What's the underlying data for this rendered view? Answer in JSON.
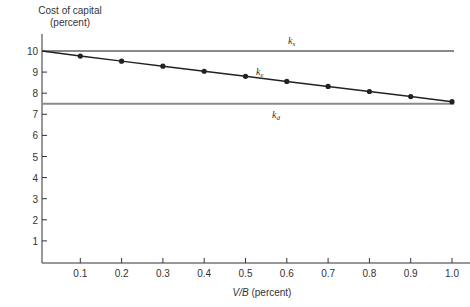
{
  "chart_data": {
    "type": "line",
    "title": "",
    "ylabel": "Cost of capital",
    "ylabel_unit": "(percent)",
    "xlabel": "V/B (percent)",
    "xlabel_italic_part": "V/B",
    "xlabel_unit": "(percent)",
    "xlim": [
      0,
      1.0
    ],
    "ylim": [
      0,
      10
    ],
    "grid": false,
    "legend": "inline labels on lines",
    "x_ticks": [
      "0.1",
      "0.2",
      "0.3",
      "0.4",
      "0.5",
      "0.6",
      "0.7",
      "0.8",
      "0.9",
      "1.0"
    ],
    "y_ticks": [
      "1",
      "2",
      "3",
      "4",
      "5",
      "6",
      "7",
      "8",
      "9",
      "10"
    ],
    "x": [
      0,
      0.1,
      0.2,
      0.3,
      0.4,
      0.5,
      0.6,
      0.7,
      0.8,
      0.9,
      1.0
    ],
    "series": [
      {
        "name": "k_s",
        "label_main": "k",
        "label_sub": "s",
        "style": "gray horizontal line",
        "color": "#8a8a8a",
        "markers": false,
        "values": [
          10,
          10,
          10,
          10,
          10,
          10,
          10,
          10,
          10,
          10,
          10
        ]
      },
      {
        "name": "k_e",
        "label_main": "k",
        "label_sub": "e",
        "style": "black line with dot markers",
        "color": "#222222",
        "markers": true,
        "values": [
          10.0,
          9.76,
          9.52,
          9.28,
          9.04,
          8.8,
          8.56,
          8.32,
          8.08,
          7.84,
          7.6
        ]
      },
      {
        "name": "k_d",
        "label_main": "k",
        "label_sub": "d",
        "style": "gray horizontal line",
        "color": "#8a8a8a",
        "markers": false,
        "values": [
          7.5,
          7.5,
          7.5,
          7.5,
          7.5,
          7.5,
          7.5,
          7.5,
          7.5,
          7.5,
          7.5
        ]
      }
    ]
  },
  "axes": {
    "y_title_line1": "Cost of capital",
    "y_title_line2": "(percent)",
    "x_title_italic": "V/B",
    "x_title_rest": " (percent)"
  },
  "labels": {
    "ks_main": "k",
    "ks_sub": "s",
    "ke_main": "k",
    "ke_sub": "e",
    "kd_main": "k",
    "kd_sub": "d"
  },
  "colors": {
    "axis": "#333333",
    "reference_line": "#8a8a8a",
    "ke_line": "#222222"
  }
}
